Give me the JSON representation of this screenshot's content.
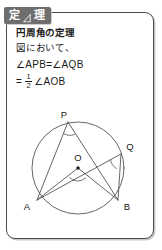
{
  "header": {
    "tab_first_char": "定",
    "tab_last_char": "理",
    "tab_icon": "set-square-triangle-icon",
    "tab_full_label": "定理"
  },
  "content": {
    "theorem_title": "円周角の定理",
    "figure_intro": "図において、",
    "equation_line_1": "∠APB=∠AQB",
    "equation_line_2": {
      "equals": "=",
      "fraction_numerator": "1",
      "fraction_denominator": "2",
      "angle_term": "∠AOB"
    }
  },
  "diagram": {
    "type": "circle-inscribed-angle",
    "center_label": "O",
    "points": [
      {
        "label": "P",
        "role": "inscribed-vertex-top"
      },
      {
        "label": "Q",
        "role": "inscribed-vertex-right"
      },
      {
        "label": "A",
        "role": "chord-endpoint-left"
      },
      {
        "label": "B",
        "role": "chord-endpoint-right"
      },
      {
        "label": "O",
        "role": "circle-center"
      }
    ],
    "angle_marks": [
      {
        "at": "P",
        "name": "angle-APB"
      },
      {
        "at": "Q",
        "name": "angle-AQB"
      },
      {
        "at": "O",
        "name": "angle-AOB"
      }
    ]
  },
  "colors": {
    "tab_background": "#6e6e6e",
    "tab_text": "#ffffff",
    "frame_border": "#4c4c4c",
    "text": "#1a1a1a",
    "diagram_stroke": "#555555",
    "page_background": "#ffffff"
  }
}
